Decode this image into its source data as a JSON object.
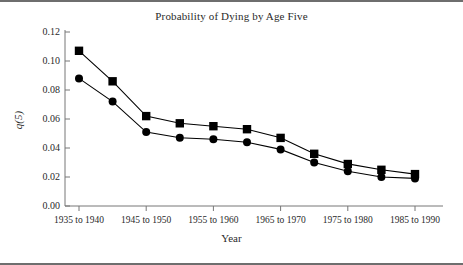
{
  "chart_data": {
    "type": "line",
    "title": "Probability of Dying by Age Five",
    "xlabel": "Year",
    "ylabel": "q(5)",
    "grid": false,
    "legend": "none",
    "ylim": [
      0.0,
      0.12
    ],
    "ytick_labels": [
      "0.00",
      "0.02",
      "0.04",
      "0.06",
      "0.08",
      "0.10",
      "0.12"
    ],
    "ytick_values": [
      0.0,
      0.02,
      0.04,
      0.06,
      0.08,
      0.1,
      0.12
    ],
    "categories": [
      "1935 to 1940",
      "1940 to 1945",
      "1945 to 1950",
      "1950 to 1955",
      "1955 to 1960",
      "1960 to 1965",
      "1965 to 1970",
      "1970 to 1975",
      "1975 to 1980",
      "1980 to 1985",
      "1985 to 1990"
    ],
    "xtick_labels_shown": [
      "1935 to 1940",
      "1945 to 1950",
      "1955 to 1960",
      "1965 to 1970",
      "1975 to 1980",
      "1985 to 1990"
    ],
    "series": [
      {
        "name": "upper-series",
        "marker": "square",
        "color": "#000000",
        "values": [
          0.107,
          0.086,
          0.062,
          0.057,
          0.055,
          0.053,
          0.047,
          0.036,
          0.029,
          0.025,
          0.022
        ]
      },
      {
        "name": "lower-series",
        "marker": "circle",
        "color": "#000000",
        "values": [
          0.088,
          0.072,
          0.051,
          0.047,
          0.046,
          0.044,
          0.039,
          0.03,
          0.024,
          0.02,
          0.019
        ]
      }
    ]
  }
}
